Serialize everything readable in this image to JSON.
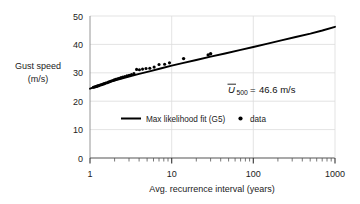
{
  "chart_data": {
    "type": "scatter",
    "title": "",
    "xlabel": "Avg. recurrence interval  (years)",
    "ylabel_line1": "Gust speed",
    "ylabel_line2": "(m/s)",
    "xscale": "log",
    "yscale": "linear",
    "xlim": [
      1,
      1000
    ],
    "ylim": [
      0,
      50
    ],
    "xticks": [
      1,
      10,
      100,
      1000
    ],
    "xtick_labels": [
      "1",
      "10",
      "100",
      "1000"
    ],
    "yticks": [
      0,
      10,
      20,
      30,
      40,
      50
    ],
    "ytick_labels": [
      "0",
      "10",
      "20",
      "30",
      "40",
      "50"
    ],
    "grid": true,
    "grid_color": "#d9d9d9",
    "series": [
      {
        "name": "Max likelihood fit (G5)",
        "type": "line",
        "color": "#000000",
        "x": [
          1.0,
          1.3,
          1.7,
          2.2,
          3.0,
          4.0,
          5.5,
          7.5,
          10,
          14,
          20,
          30,
          45,
          70,
          100,
          150,
          220,
          330,
          500,
          700,
          1000
        ],
        "y": [
          24.4,
          25.6,
          26.7,
          27.6,
          28.7,
          29.6,
          30.6,
          31.6,
          32.5,
          33.5,
          34.5,
          35.7,
          36.8,
          38.1,
          39.1,
          40.3,
          41.4,
          42.6,
          43.8,
          44.9,
          46.2
        ]
      },
      {
        "name": "data",
        "type": "scatter",
        "color": "#000000",
        "x": [
          1.1,
          1.13,
          1.16,
          1.19,
          1.22,
          1.25,
          1.29,
          1.33,
          1.37,
          1.41,
          1.46,
          1.51,
          1.56,
          1.62,
          1.68,
          1.75,
          1.82,
          1.9,
          1.98,
          2.07,
          2.17,
          2.28,
          2.4,
          2.53,
          2.68,
          2.84,
          3.02,
          3.22,
          3.45,
          3.72,
          4.03,
          4.4,
          4.85,
          5.4,
          6.1,
          7.0,
          8.2,
          9.4,
          14.0,
          28.0,
          30.0
        ],
        "y": [
          24.9,
          25.0,
          25.1,
          25.2,
          25.3,
          25.4,
          25.5,
          25.7,
          25.8,
          25.9,
          26.1,
          26.2,
          26.4,
          26.5,
          26.7,
          26.9,
          27.1,
          27.3,
          27.5,
          27.7,
          27.9,
          28.1,
          28.3,
          28.5,
          28.7,
          28.9,
          29.1,
          29.4,
          29.7,
          31.2,
          31.1,
          31.3,
          31.5,
          31.6,
          32.0,
          32.9,
          33.0,
          33.5,
          35.0,
          36.3,
          36.7
        ]
      }
    ],
    "annotation": {
      "symbol": "U",
      "overbar": true,
      "subscript": "500",
      "equals": "=",
      "value": "46.6 m/s",
      "full_text": "U̅500 = 46.6 m/s"
    },
    "legend": {
      "position": "inside-lower-center",
      "entries": [
        {
          "label": "Max likelihood fit (G5)",
          "marker": "line",
          "color": "#000000"
        },
        {
          "label": "data",
          "marker": "dot",
          "color": "#000000"
        }
      ]
    }
  }
}
